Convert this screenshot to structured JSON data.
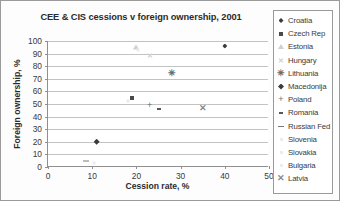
{
  "chart_data": {
    "type": "scatter",
    "title": "CEE & CIS cessions v foreign ownership, 2001",
    "xlabel": "Cession rate, %",
    "ylabel": "Foreign ownership, %",
    "xlim": [
      0,
      50
    ],
    "ylim": [
      0,
      100
    ],
    "xticks": [
      0,
      10,
      20,
      30,
      40,
      50
    ],
    "yticks": [
      0,
      10,
      20,
      30,
      40,
      50,
      60,
      70,
      80,
      90,
      100
    ],
    "grid": "horizontal",
    "legend_position": "right",
    "series": [
      {
        "name": "Croatia",
        "marker": "diamond",
        "x": 40.0,
        "y": 96
      },
      {
        "name": "Czech Rep",
        "marker": "square",
        "x": 19.0,
        "y": 55
      },
      {
        "name": "Estonia",
        "marker": "triangle",
        "x": 20.0,
        "y": 95
      },
      {
        "name": "Hungary",
        "marker": "x-light",
        "x": 23.0,
        "y": 89
      },
      {
        "name": "Lithuania",
        "marker": "star",
        "x": 28.0,
        "y": 75
      },
      {
        "name": "Macedonija",
        "marker": "diamond-big",
        "x": 11.0,
        "y": 20
      },
      {
        "name": "Poland",
        "marker": "plus",
        "x": 23.0,
        "y": 49
      },
      {
        "name": "Romania",
        "marker": "dash-small",
        "x": 25.0,
        "y": 46
      },
      {
        "name": "Russian Fed",
        "marker": "dash-long",
        "x": 8.5,
        "y": 5
      },
      {
        "name": "Slovenia",
        "marker": "none",
        "x": 18.0,
        "y": 52
      },
      {
        "name": "Slovakia",
        "marker": "none",
        "x": 20.3,
        "y": 93
      },
      {
        "name": "Bulgaria",
        "marker": "none",
        "x": 10.5,
        "y": 3
      },
      {
        "name": "Latvia",
        "marker": "x-dark",
        "x": 35.0,
        "y": 47
      }
    ]
  },
  "legend": {
    "items": [
      {
        "label": "Croatia"
      },
      {
        "label": "Czech Rep"
      },
      {
        "label": "Estonia"
      },
      {
        "label": "Hungary"
      },
      {
        "label": "Lithuania"
      },
      {
        "label": "Macedonija"
      },
      {
        "label": "Poland"
      },
      {
        "label": "Romania"
      },
      {
        "label": "Russian Fed"
      },
      {
        "label": "Slovenia"
      },
      {
        "label": "Slovakia"
      },
      {
        "label": "Bulgaria"
      },
      {
        "label": "Latvia"
      }
    ]
  },
  "axis": {
    "y_tick_labels": [
      "100",
      "90",
      "80",
      "70",
      "60",
      "50",
      "40",
      "30",
      "20",
      "10",
      "0"
    ],
    "x_tick_labels": [
      "0",
      "10",
      "20",
      "30",
      "40",
      "50"
    ]
  },
  "colors": {
    "frame": "#9a9a9a",
    "grid": "#c3c3c3",
    "axis": "#8f8f8f",
    "text": "#2b2b2b"
  }
}
